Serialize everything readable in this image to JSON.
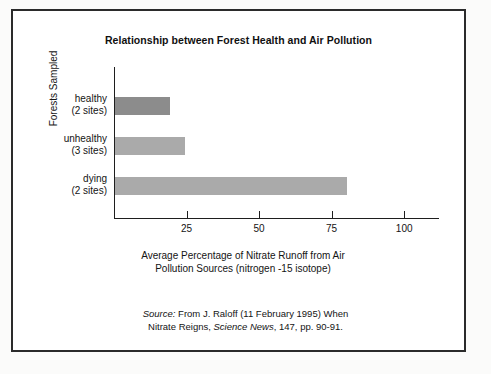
{
  "figure": {
    "title": "Relationship between Forest Health and Air Pollution",
    "background": "#ffffff",
    "frame_color": "#2b2b2b"
  },
  "chart_data": {
    "type": "bar",
    "orientation": "horizontal",
    "title": "Relationship between Forest Health and Air Pollution",
    "categories": [
      "healthy\n(2 sites)",
      "unhealthy\n(3 sites)",
      "dying\n(2 sites)"
    ],
    "category_names": [
      "healthy",
      "unhealthy",
      "dying"
    ],
    "category_sublabels": [
      "(2 sites)",
      "(3 sites)",
      "(2 sites)"
    ],
    "values": [
      19,
      24,
      80
    ],
    "bar_colors": [
      "#8c8c8c",
      "#aaaaaa",
      "#aaaaaa"
    ],
    "xlabel": "Average Percentage of Nitrate Runoff from Air Pollution Sources (nitrogen -15 isotope)",
    "ylabel": "Forests Sampled",
    "xlim": [
      0,
      112
    ],
    "xticks": [
      25,
      50,
      75,
      100
    ],
    "xtick_labels": [
      "25",
      "50",
      "75",
      "100"
    ],
    "grid": false,
    "legend": false
  },
  "axes": {
    "y_title": "Forests Sampled",
    "x_title_line1": "Average Percentage of Nitrate Runoff from Air",
    "x_title_line2": "Pollution Sources (nitrogen -15 isotope)",
    "ticks": [
      {
        "value": 25,
        "label": "25"
      },
      {
        "value": 50,
        "label": "50"
      },
      {
        "value": 75,
        "label": "75"
      },
      {
        "value": 100,
        "label": "100"
      }
    ]
  },
  "bars": [
    {
      "name": "healthy",
      "sublabel": "(2 sites)",
      "value": 19,
      "color": "#8c8c8c"
    },
    {
      "name": "unhealthy",
      "sublabel": "(3 sites)",
      "value": 24,
      "color": "#aaaaaa"
    },
    {
      "name": "dying",
      "sublabel": "(2 sites)",
      "value": 80,
      "color": "#aaaaaa"
    }
  ],
  "source": {
    "label": "Source:",
    "line1_rest": " From J. Raloff (11 February 1995) When",
    "line2_pre": "Nitrate Reigns, ",
    "line2_italic": "Science News",
    "line2_post": ", 147, pp. 90-91."
  }
}
